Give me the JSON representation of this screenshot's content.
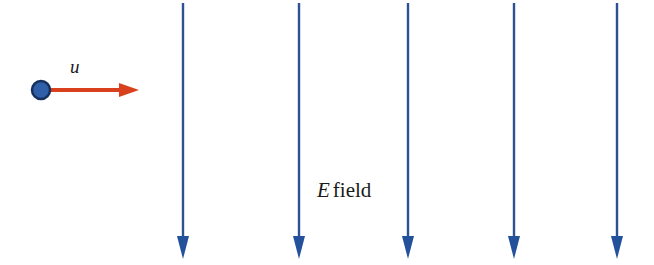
{
  "figure": {
    "width": 654,
    "height": 265,
    "background": "#ffffff"
  },
  "colors": {
    "field_line": "#2d5193",
    "field_line_arrowhead": "#23519b",
    "particle_fill": "#2f5fa8",
    "particle_stroke": "#16305e",
    "velocity_arrow": "#d9411e",
    "text": "#1a1a1a"
  },
  "particle": {
    "name": "charged-particle",
    "cx": 41,
    "cy": 90,
    "r": 9
  },
  "velocity_vector": {
    "label": "u",
    "label_x": 70,
    "label_y": 57,
    "shaft_start_x": 45,
    "shaft_end_x": 119,
    "tip_x": 139,
    "y": 90,
    "stroke_width": 4
  },
  "efield_label": {
    "symbol": "E",
    "word": "field",
    "x": 317,
    "y": 180
  },
  "field_lines": {
    "count": 5,
    "top_y": 3,
    "line_bottom_y": 236,
    "tip_y": 259,
    "head_half_width": 6,
    "stroke_width": 2.4,
    "x_positions": [
      183,
      299,
      408,
      514,
      617
    ]
  },
  "chart_data": {
    "type": "diagram",
    "annotations": [
      "u",
      "E field"
    ],
    "series": [
      {
        "name": "field-lines",
        "direction": "downward",
        "x": [
          183,
          299,
          408,
          514,
          617
        ],
        "y_start": 3,
        "y_end": 259
      },
      {
        "name": "velocity-vector",
        "direction": "rightward",
        "x_start": 45,
        "x_end": 139,
        "y": 90
      }
    ]
  }
}
